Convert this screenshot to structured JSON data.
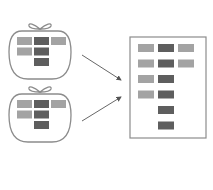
{
  "diagram": {
    "colors": {
      "light": "#a3a3a3",
      "dark": "#5e5e5e",
      "outline": "#8c8c8c",
      "arrow": "#555555",
      "background": "#ffffff"
    },
    "bags": [
      {
        "id": "bag-1",
        "cells": [
          {
            "row": 0,
            "col": 0,
            "shade": "light"
          },
          {
            "row": 0,
            "col": 1,
            "shade": "dark"
          },
          {
            "row": 0,
            "col": 2,
            "shade": "light"
          },
          {
            "row": 1,
            "col": 0,
            "shade": "light"
          },
          {
            "row": 1,
            "col": 1,
            "shade": "dark"
          },
          {
            "row": 2,
            "col": 1,
            "shade": "dark"
          }
        ]
      },
      {
        "id": "bag-2",
        "cells": [
          {
            "row": 0,
            "col": 0,
            "shade": "light"
          },
          {
            "row": 0,
            "col": 1,
            "shade": "dark"
          },
          {
            "row": 0,
            "col": 2,
            "shade": "light"
          },
          {
            "row": 1,
            "col": 0,
            "shade": "light"
          },
          {
            "row": 1,
            "col": 1,
            "shade": "dark"
          },
          {
            "row": 2,
            "col": 1,
            "shade": "dark"
          }
        ]
      }
    ],
    "arrows": [
      {
        "from": "bag-1",
        "to": "merged-document"
      },
      {
        "from": "bag-2",
        "to": "merged-document"
      }
    ],
    "merged_document": {
      "rows": 6,
      "cells": [
        {
          "row": 0,
          "col": 0,
          "shade": "light"
        },
        {
          "row": 0,
          "col": 1,
          "shade": "dark"
        },
        {
          "row": 0,
          "col": 2,
          "shade": "light"
        },
        {
          "row": 1,
          "col": 0,
          "shade": "light"
        },
        {
          "row": 1,
          "col": 1,
          "shade": "dark"
        },
        {
          "row": 1,
          "col": 2,
          "shade": "light"
        },
        {
          "row": 2,
          "col": 0,
          "shade": "light"
        },
        {
          "row": 2,
          "col": 1,
          "shade": "dark"
        },
        {
          "row": 3,
          "col": 0,
          "shade": "light"
        },
        {
          "row": 3,
          "col": 1,
          "shade": "dark"
        },
        {
          "row": 4,
          "col": 1,
          "shade": "dark"
        },
        {
          "row": 5,
          "col": 1,
          "shade": "dark"
        }
      ]
    }
  }
}
